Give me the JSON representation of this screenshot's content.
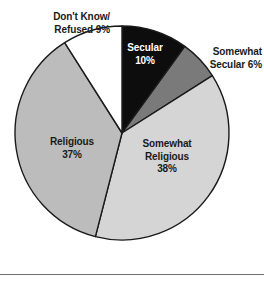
{
  "chart_data": {
    "type": "pie",
    "title": "",
    "subtitle": "",
    "xlabel": "",
    "ylabel": "",
    "legend_position": "none",
    "grid": false,
    "start_angle_deg": 0,
    "direction": "clockwise",
    "total_percent": 100,
    "categories": [
      "Secular",
      "Somewhat Secular",
      "Somewhat Religious",
      "Religious",
      "Don't Know/Refused"
    ],
    "values": [
      10,
      6,
      38,
      37,
      9
    ],
    "value_unit": "%",
    "slices": [
      {
        "name": "Secular",
        "value": 10,
        "label_text": "Secular\n10%",
        "label_placement": "inside",
        "color": "#0d0d0d",
        "text_color": "#ffffff"
      },
      {
        "name": "Somewhat Secular",
        "value": 6,
        "label_text": "Somewhat\nSecular 6%",
        "label_placement": "outside",
        "color": "#7a7a7a",
        "text_color": "#1a1a1a"
      },
      {
        "name": "Somewhat Religious",
        "value": 38,
        "label_text": "Somewhat\nReligious\n38%",
        "label_placement": "inside",
        "color": "#d5d5d5",
        "text_color": "#1a1a1a"
      },
      {
        "name": "Religious",
        "value": 37,
        "label_text": "Religious\n37%",
        "label_placement": "inside",
        "color": "#bcbcbc",
        "text_color": "#1a1a1a"
      },
      {
        "name": "Don't Know/Refused",
        "value": 9,
        "label_text": "Don't Know/\nRefused 9%",
        "label_placement": "outside",
        "color": "#ffffff",
        "text_color": "#1a1a1a"
      }
    ],
    "geometry": {
      "center_x": 122,
      "center_y": 133,
      "radius": 107,
      "outline_color": "#1a1a1a",
      "outline_width": 1.4
    }
  },
  "footer": {
    "rule_color": "#6e6e6e"
  }
}
